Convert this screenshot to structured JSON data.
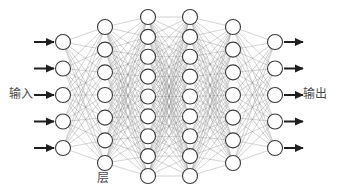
{
  "figure": {
    "kind": "neural-network-diagram",
    "background_color": "#ffffff",
    "width": 338,
    "height": 194
  },
  "labels": {
    "input": "输入",
    "output": "输出",
    "layer": "层"
  },
  "style": {
    "node_fill": "#ffffff",
    "node_stroke": "#3a3a3a",
    "node_stroke_width": 1.1,
    "edge_color": "#8d8d8d",
    "edge_width": 0.45,
    "arrow_color": "#1f1f1f",
    "arrow_width": 2.0,
    "label_color": "#4a4a4a",
    "label_font_size": 12
  },
  "network": {
    "layer_count": 6,
    "layers": [
      {
        "name": "input-layer",
        "role": "input",
        "node_count": 5,
        "cx": 63,
        "radius": 7.5,
        "y_top": 42,
        "y_bottom": 148
      },
      {
        "name": "hidden-layer-1",
        "role": "hidden",
        "node_count": 7,
        "cx": 105,
        "radius": 7.5,
        "y_top": 27,
        "y_bottom": 163
      },
      {
        "name": "hidden-layer-2",
        "role": "hidden",
        "node_count": 9,
        "cx": 148,
        "radius": 7.5,
        "y_top": 17,
        "y_bottom": 176
      },
      {
        "name": "hidden-layer-3",
        "role": "hidden",
        "node_count": 9,
        "cx": 190,
        "radius": 7.5,
        "y_top": 17,
        "y_bottom": 176
      },
      {
        "name": "hidden-layer-4",
        "role": "hidden",
        "node_count": 7,
        "cx": 233,
        "radius": 7.5,
        "y_top": 27,
        "y_bottom": 163
      },
      {
        "name": "output-layer",
        "role": "output",
        "node_count": 5,
        "cx": 275,
        "radius": 7.5,
        "y_top": 42,
        "y_bottom": 148
      }
    ],
    "input_arrows": {
      "count": 5,
      "x_start": 34,
      "x_end": 54,
      "ys": [
        42,
        68.5,
        95,
        121.5,
        148
      ]
    },
    "output_arrows": {
      "count": 5,
      "x_start": 284,
      "x_end": 303,
      "ys": [
        42,
        68.5,
        95,
        121.5,
        148
      ]
    }
  }
}
